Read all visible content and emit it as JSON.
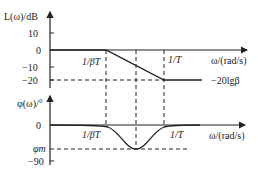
{
  "upper_plot": {
    "y_axis_label": "L(ω)/dB",
    "y_ticks": [
      "10",
      "0",
      "−10",
      "−20"
    ],
    "x_axis_label": "ω/(rad/s)",
    "corner1_label": "1/βT",
    "corner2_label": "1/T",
    "asymptote_label": "−20lgβ"
  },
  "lower_plot": {
    "y_axis_label": "φ(ω)/°",
    "y_ticks": [
      "0",
      "−90"
    ],
    "phi_m_label": "φm",
    "x_axis_label": "ω/(rad/s)",
    "corner1_label": "1/βT",
    "corner2_label": "1/T"
  },
  "colors": {
    "line": "#222222",
    "background": "#ffffff"
  }
}
